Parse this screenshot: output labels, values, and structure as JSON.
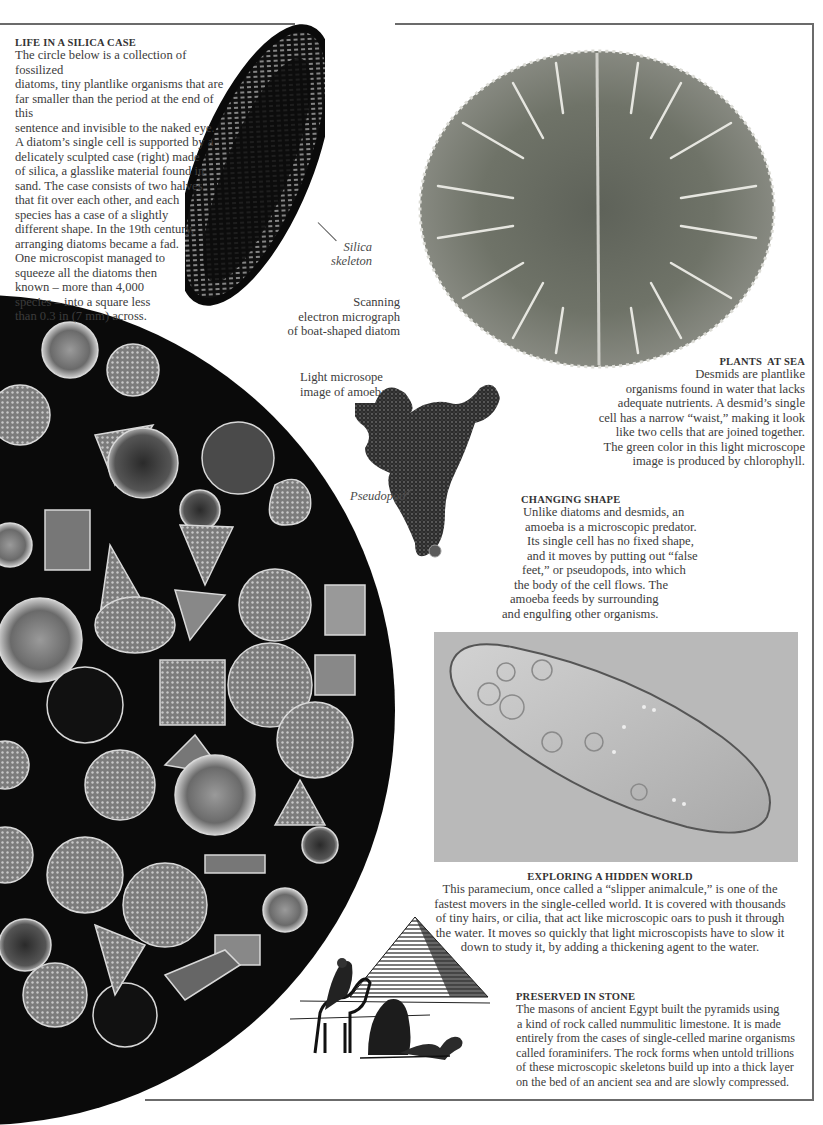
{
  "sections": {
    "silica": {
      "heading": "LIFE IN A SILICA CASE",
      "lines": [
        "The circle below is a collection of fossilized",
        "diatoms, tiny plantlike organisms that are",
        "far smaller than the period at the end of this",
        "sentence and invisible to the naked eye.",
        "A diatom’s single cell is supported by a",
        "delicately sculpted case (right) made",
        "of silica, a glasslike material found in",
        "sand. The case consists of two halves",
        "that fit over each other, and each",
        "species has a case of a slightly",
        "different shape. In the 19th century,",
        "arranging diatoms became a fad.",
        "One microscopist managed to",
        "squeeze all the diatoms then",
        "known – more than 4,000",
        "species – into a square less",
        "than 0.3 in (7 mm) across."
      ]
    },
    "plants_at_sea": {
      "heading": "PLANTS  AT SEA",
      "lines": [
        "Desmids are plantlike",
        "organisms found in water that lacks",
        "adequate nutrients. A desmid’s single",
        "cell has a narrow “waist,” making it look",
        "like two cells that are joined together.",
        "The green color in this light microscope",
        "image is produced by chlorophyll."
      ]
    },
    "changing_shape": {
      "heading": "CHANGING SHAPE",
      "lines": [
        "Unlike diatoms and desmids, an",
        "amoeba is a microscopic predator.",
        "Its single cell has no fixed shape,",
        "and it moves by putting out “false",
        "feet,” or pseudopods, into which",
        "the body of the cell flows. The",
        "amoeba feeds by surrounding",
        "and engulfing other organisms."
      ]
    },
    "hidden_world": {
      "heading": "EXPLORING A HIDDEN WORLD",
      "lines": [
        "This paramecium, once called a “slipper animalcule,” is one of the",
        "fastest movers in the single-celled world. It is covered with thousands",
        "of tiny hairs, or cilia, that act like microscopic oars to push it through",
        "the water. It moves so quickly that light microscopists have to slow it",
        "down to study it, by adding a thickening agent to the water."
      ]
    },
    "stone": {
      "heading": "PRESERVED IN STONE",
      "lines": [
        "The masons of ancient Egypt built the pyramids using",
        "a kind of rock called nummulitic limestone. It is made",
        "entirely from the cases of single-celled marine organisms",
        "called foraminifers. The rock forms when untold trillions",
        "of these microscopic skeletons build up into a thick layer",
        "on the bed of an ancient sea and are slowly compressed."
      ]
    }
  },
  "captions": {
    "silica_label": [
      "Silica",
      "skeleton"
    ],
    "sem": [
      "Scanning",
      "electron micrograph",
      "of boat-shaped diatom"
    ],
    "amoeba": [
      "Light microsope",
      "image of amoeba"
    ],
    "pseudopod": "Pseudopod"
  },
  "images": {
    "diatom_sem": "boat-shaped diatom SEM",
    "desmid": "desmid light micrograph",
    "amoeba": "amoeba light micrograph",
    "diatom_collage": "fossilized diatom collage circle",
    "paramecium": "paramecium micrograph",
    "pyramid": "pyramid and camels illustration"
  },
  "colors": {
    "rule": "#6b6b6b",
    "text": "#3c3c3c",
    "collage_bg": "#0a0a0a",
    "paramecium_bg": "#b9b9b9",
    "desmid_tone": "#6f7368"
  }
}
